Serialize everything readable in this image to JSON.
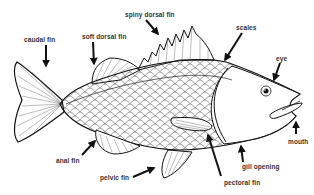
{
  "diagram": {
    "labels": [
      {
        "id": "caudal_fin",
        "text": "caudal fin"
      },
      {
        "id": "soft_dorsal_fin",
        "text": "soft dorsal fin"
      },
      {
        "id": "spiny_dorsal_fin",
        "text": "spiny dorsal fin"
      },
      {
        "id": "scales",
        "text": "scales"
      },
      {
        "id": "eye",
        "text": "eye"
      },
      {
        "id": "mouth",
        "text": "mouth"
      },
      {
        "id": "gill_opening",
        "text": "gill opening"
      },
      {
        "id": "pectoral_fin",
        "text": "pectoral fin"
      },
      {
        "id": "pelvic_fin",
        "text": "pelvic fin"
      },
      {
        "id": "anal_fin",
        "text": "anal fin"
      }
    ],
    "colors": {
      "line": "#1a1a1a",
      "background": "#ffffff",
      "label": "#333333"
    }
  }
}
